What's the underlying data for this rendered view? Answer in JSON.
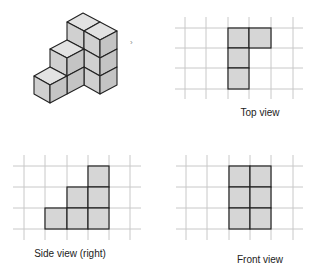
{
  "figure": {
    "views": [
      {
        "id": "top",
        "label": "Top view",
        "filled_cells": [
          [
            2,
            0
          ],
          [
            3,
            0
          ],
          [
            2,
            1
          ],
          [
            2,
            2
          ]
        ]
      },
      {
        "id": "side",
        "label": "Side view (right)",
        "filled_cells": [
          [
            4,
            0
          ],
          [
            3,
            1
          ],
          [
            4,
            1
          ],
          [
            2,
            2
          ],
          [
            3,
            2
          ],
          [
            4,
            2
          ]
        ]
      },
      {
        "id": "front",
        "label": "Front view",
        "filled_cells": [
          [
            2,
            0
          ],
          [
            3,
            0
          ],
          [
            2,
            1
          ],
          [
            3,
            1
          ],
          [
            2,
            2
          ],
          [
            3,
            2
          ]
        ]
      }
    ],
    "arrow_marker": "›"
  },
  "colors": {
    "grid": "#c8c8c8",
    "cell_fill": "#d6d6d6",
    "cell_stroke": "#222222",
    "cube_top": "#e2e2e2",
    "cube_left": "#d0d0d0",
    "cube_right": "#c4c4c4"
  }
}
